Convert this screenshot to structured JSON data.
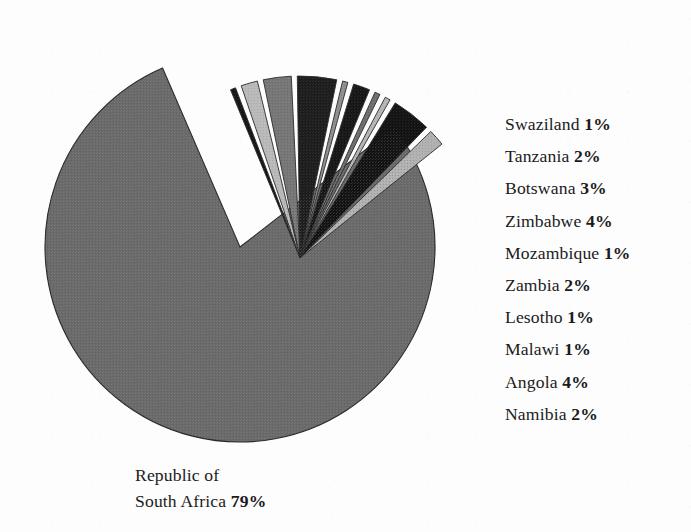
{
  "background_color": "#fdfdfd",
  "text_color": "#1b1b1b",
  "main_label": {
    "line1": "Republic of",
    "line2_name": "South Africa ",
    "line2_pct": "79%"
  },
  "legend": [
    {
      "name": "Swaziland ",
      "pct": "1%"
    },
    {
      "name": "Tanzania ",
      "pct": "2%"
    },
    {
      "name": "Botswana ",
      "pct": "3%"
    },
    {
      "name": "Zimbabwe ",
      "pct": "4%"
    },
    {
      "name": "Mozambique ",
      "pct": "1%"
    },
    {
      "name": "Zambia ",
      "pct": "2%"
    },
    {
      "name": "Lesotho ",
      "pct": "1%"
    },
    {
      "name": "Malawi ",
      "pct": "1%"
    },
    {
      "name": "Angola ",
      "pct": "4%"
    },
    {
      "name": "Namibia ",
      "pct": "2%"
    }
  ],
  "chart_data": {
    "type": "pie",
    "title": "",
    "total_percent": 100,
    "legend_position": "right",
    "grid": false,
    "geometry": {
      "main_center_x": 240,
      "main_center_y": 247,
      "main_radius": 195,
      "exploded_apex_x": 300,
      "exploded_apex_y": 258,
      "exploded_radius": 182,
      "gap_degrees": 1.9,
      "start_angle_degrees": -37.8
    },
    "labels": [
      "Republic of South Africa",
      "Swaziland",
      "Tanzania",
      "Botswana",
      "Zimbabwe",
      "Mozambique",
      "Zambia",
      "Lesotho",
      "Malawi",
      "Angola",
      "Namibia"
    ],
    "values": [
      79,
      1,
      2,
      3,
      4,
      1,
      2,
      1,
      1,
      4,
      2
    ],
    "slices": [
      {
        "label": "Republic of South Africa",
        "value": 79,
        "color": "#6a6a6a",
        "exploded": false
      },
      {
        "label": "Swaziland",
        "value": 1,
        "color": "#151515",
        "exploded": true
      },
      {
        "label": "Tanzania",
        "value": 2,
        "color": "#b9b9b9",
        "exploded": true
      },
      {
        "label": "Botswana",
        "value": 3,
        "color": "#767676",
        "exploded": true
      },
      {
        "label": "Zimbabwe",
        "value": 4,
        "color": "#1d1d1d",
        "exploded": true
      },
      {
        "label": "Mozambique",
        "value": 1,
        "color": "#8f8f8f",
        "exploded": true
      },
      {
        "label": "Zambia",
        "value": 2,
        "color": "#171717",
        "exploded": true
      },
      {
        "label": "Lesotho",
        "value": 1,
        "color": "#6f6f6f",
        "exploded": true
      },
      {
        "label": "Malawi",
        "value": 1,
        "color": "#b5b5b5",
        "exploded": true
      },
      {
        "label": "Angola",
        "value": 4,
        "color": "#131313",
        "exploded": true
      },
      {
        "label": "Namibia",
        "value": 2,
        "color": "#b0b0b0",
        "exploded": true
      }
    ]
  }
}
